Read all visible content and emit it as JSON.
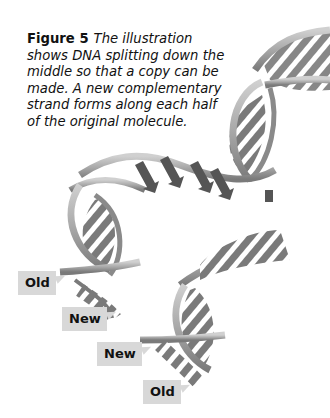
{
  "figure": {
    "number_label": "Figure 5",
    "caption": "The illustration shows DNA splitting down the middle so that a copy can be made. A new complementary strand forms along each half of the original molecule."
  },
  "labels": [
    {
      "text": "Old"
    },
    {
      "text": "New"
    },
    {
      "text": "New"
    },
    {
      "text": "Old"
    }
  ],
  "colors": {
    "label_bg": "#d8d8d8",
    "ribbon_light": "#b5b5b5",
    "ribbon_dark": "#6e6e6e",
    "base_pair": "#4a4a4a"
  }
}
